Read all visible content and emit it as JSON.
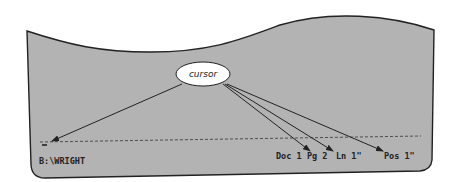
{
  "callout": {
    "label": "cursor"
  },
  "status_bar": {
    "path": "B:\\WRIGHT",
    "doc": "Doc 1",
    "page": "Pg 2",
    "line": "Ln 1\"",
    "position": "Pos 1\""
  },
  "colors": {
    "screen_fill": "#b3b3b3",
    "outline": "#222222",
    "callout_fill": "#ffffff"
  }
}
